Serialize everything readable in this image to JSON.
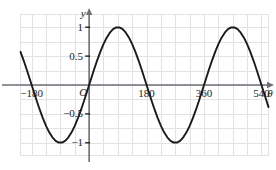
{
  "chart_data": {
    "type": "line",
    "title": "",
    "subtitle": "",
    "xlabel": "θ",
    "ylabel": "y",
    "origin_label": "O",
    "function": "y = sin(θ)",
    "xlim": [
      -215,
      562
    ],
    "ylim": [
      -1.22,
      1.22
    ],
    "grid": true,
    "grid_color": "#e2e2e2",
    "axis_color": "#6e6e76",
    "curve_color": "#1b1b1b",
    "legend": null,
    "x_ticks": [
      {
        "value": -180,
        "label": "−180"
      },
      {
        "value": 180,
        "label": "180"
      },
      {
        "value": 360,
        "label": "360"
      },
      {
        "value": 540,
        "label": "540"
      }
    ],
    "y_ticks": [
      {
        "value": 1,
        "label": "1"
      },
      {
        "value": 0.5,
        "label": "0.5"
      },
      {
        "value": -0.5,
        "label": "−0.5"
      },
      {
        "value": -1,
        "label": "−1"
      }
    ],
    "x_grid_step": 45,
    "y_grid_step": 0.25,
    "zero_crossings": [
      -180,
      0,
      180,
      360,
      540
    ],
    "maxima": [
      {
        "x": 90,
        "y": 1
      },
      {
        "x": 450,
        "y": 1
      }
    ],
    "minima": [
      {
        "x": -90,
        "y": -1
      },
      {
        "x": 270,
        "y": -1
      }
    ],
    "x": [
      -215,
      -205,
      -195,
      -185,
      -175,
      -165,
      -155,
      -145,
      -135,
      -125,
      -115,
      -105,
      -95,
      -85,
      -75,
      -65,
      -55,
      -45,
      -35,
      -25,
      -15,
      -5,
      5,
      15,
      25,
      35,
      45,
      55,
      65,
      75,
      85,
      95,
      105,
      115,
      125,
      135,
      145,
      155,
      165,
      175,
      185,
      195,
      205,
      215,
      225,
      235,
      245,
      255,
      265,
      275,
      285,
      295,
      305,
      315,
      325,
      335,
      345,
      355,
      365,
      375,
      385,
      395,
      405,
      415,
      425,
      435,
      445,
      455,
      465,
      475,
      485,
      495,
      505,
      515,
      525,
      535,
      545,
      555,
      562
    ],
    "y": [
      0.574,
      0.423,
      0.259,
      0.087,
      -0.087,
      -0.259,
      -0.423,
      -0.574,
      -0.707,
      -0.819,
      -0.906,
      -0.966,
      -0.996,
      -0.996,
      -0.966,
      -0.906,
      -0.819,
      -0.707,
      -0.574,
      -0.423,
      -0.259,
      -0.087,
      0.087,
      0.259,
      0.423,
      0.574,
      0.707,
      0.819,
      0.906,
      0.966,
      0.996,
      0.996,
      0.966,
      0.906,
      0.819,
      0.707,
      0.574,
      0.423,
      0.259,
      0.087,
      -0.087,
      -0.259,
      -0.423,
      -0.574,
      -0.707,
      -0.819,
      -0.906,
      -0.966,
      -0.996,
      -0.996,
      -0.966,
      -0.906,
      -0.819,
      -0.707,
      -0.574,
      -0.423,
      -0.259,
      -0.087,
      0.087,
      0.259,
      0.423,
      0.574,
      0.707,
      0.819,
      0.906,
      0.966,
      0.996,
      0.996,
      0.966,
      0.906,
      0.819,
      0.707,
      0.574,
      0.423,
      0.259,
      0.087,
      -0.087,
      -0.259,
      -0.383
    ]
  }
}
